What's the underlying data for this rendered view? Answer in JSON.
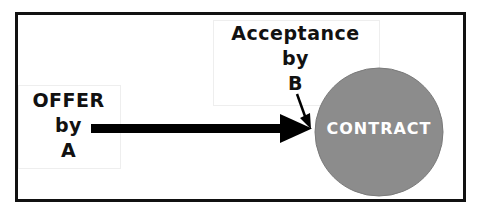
{
  "diagram": {
    "offer": {
      "lines": [
        "OFFER",
        "by",
        "A"
      ]
    },
    "acceptance": {
      "lines": [
        "Acceptance",
        "by",
        "B"
      ]
    },
    "result": {
      "label": "CONTRACT",
      "fill_color": "#8c8c8c",
      "text_color": "#ffffff"
    },
    "colors": {
      "frame": "#111111",
      "arrow": "#000000",
      "background": "#ffffff"
    }
  }
}
